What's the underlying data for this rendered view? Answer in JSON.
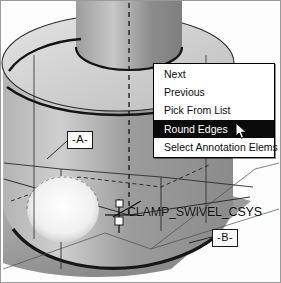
{
  "app": {
    "title": "CAD 3D Model View"
  },
  "viewport": {
    "model_name": "cylindrical clamp swivel part",
    "background_color": "#ffffff",
    "shading": {
      "top_face_color": "#d8d8d8",
      "front_face_color": "#a9a9a9",
      "side_face_color": "#8f8f8f",
      "highlight_color": "#f2f2f2",
      "edge_color": "#1a1a1a"
    }
  },
  "annotations": {
    "datum_a": "-A-",
    "datum_b": "-B-",
    "csys_label": "CLAMP_SWIVEL_CSYS"
  },
  "context_menu": {
    "items": [
      {
        "label": "Next",
        "selected": false
      },
      {
        "label": "Previous",
        "selected": false
      },
      {
        "label": "Pick From List",
        "selected": false
      },
      {
        "label": "Round Edges",
        "selected": true
      },
      {
        "label": "Select Annotation Elems",
        "selected": false
      }
    ],
    "highlight_bg": "#0b0b0b",
    "highlight_fg": "#ffffff"
  },
  "cursor": {
    "type": "arrow-pointer",
    "x": 234,
    "y": 121
  }
}
